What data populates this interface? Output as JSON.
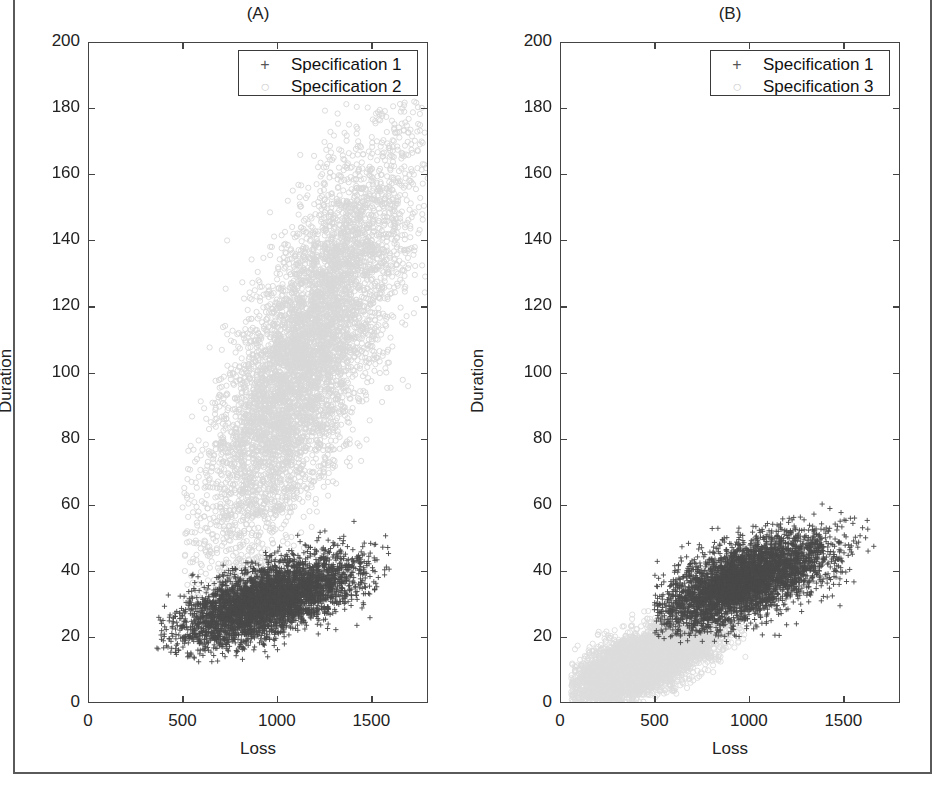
{
  "figure": {
    "background": "#ffffff",
    "border_color": "#5a5a5a"
  },
  "panels": [
    {
      "id": "A",
      "title": "(A)",
      "xlabel": "Loss",
      "ylabel": "Duration",
      "xticks": [
        0,
        500,
        1000,
        1500
      ],
      "yticks": [
        0,
        20,
        40,
        60,
        80,
        100,
        120,
        140,
        160,
        180,
        200
      ],
      "xlim": [
        0,
        1800
      ],
      "ylim": [
        0,
        200
      ],
      "legend": [
        {
          "marker": "+",
          "label": "Specification 1",
          "color": "#555555"
        },
        {
          "marker": "o",
          "label": "Specification 2",
          "color": "#d2d2d2"
        }
      ]
    },
    {
      "id": "B",
      "title": "(B)",
      "xlabel": "Loss",
      "ylabel": "Duration",
      "xticks": [
        0,
        500,
        1000,
        1500
      ],
      "yticks": [
        0,
        20,
        40,
        60,
        80,
        100,
        120,
        140,
        160,
        180,
        200
      ],
      "xlim": [
        0,
        1800
      ],
      "ylim": [
        0,
        200
      ],
      "legend": [
        {
          "marker": "+",
          "label": "Specification 1",
          "color": "#555555"
        },
        {
          "marker": "o",
          "label": "Specification 3",
          "color": "#d2d2d2"
        }
      ]
    }
  ],
  "chart_data": [
    {
      "type": "scatter",
      "panel": "A",
      "title": "(A)",
      "xlabel": "Loss",
      "ylabel": "Duration",
      "xlim": [
        0,
        1800
      ],
      "ylim": [
        0,
        200
      ],
      "xticks": [
        0,
        500,
        1000,
        1500
      ],
      "yticks": [
        0,
        20,
        40,
        60,
        80,
        100,
        120,
        140,
        160,
        180,
        200
      ],
      "grid": false,
      "legend_position": "top-right",
      "series": [
        {
          "name": "Specification 1",
          "marker": "plus",
          "color": "#4a4a4a",
          "n_points": 4200,
          "x_mean": 950,
          "x_sd": 230,
          "y_mean": 31,
          "y_sd": 6.5,
          "correlation": 0.62,
          "x_range": [
            360,
            1600
          ],
          "y_range": [
            10,
            58
          ]
        },
        {
          "name": "Specification 2",
          "marker": "circle",
          "color": "#d8d8d8",
          "n_points": 6000,
          "x_mean": 1150,
          "x_sd": 270,
          "y_mean": 105,
          "y_sd": 32,
          "correlation": 0.78,
          "x_range": [
            500,
            1800
          ],
          "y_range": [
            20,
            182
          ]
        }
      ]
    },
    {
      "type": "scatter",
      "panel": "B",
      "title": "(B)",
      "xlabel": "Loss",
      "ylabel": "Duration",
      "xlim": [
        0,
        1800
      ],
      "ylim": [
        0,
        200
      ],
      "xticks": [
        0,
        500,
        1000,
        1500
      ],
      "yticks": [
        0,
        20,
        40,
        60,
        80,
        100,
        120,
        140,
        160,
        180,
        200
      ],
      "grid": false,
      "legend_position": "top-right",
      "series": [
        {
          "name": "Specification 1",
          "marker": "plus",
          "color": "#4a4a4a",
          "n_points": 4200,
          "x_mean": 980,
          "x_sd": 225,
          "y_mean": 37,
          "y_sd": 7.0,
          "correlation": 0.6,
          "x_range": [
            500,
            1680
          ],
          "y_range": [
            18,
            62
          ]
        },
        {
          "name": "Specification 3",
          "marker": "circle",
          "color": "#dcdcdc",
          "n_points": 5200,
          "x_mean": 430,
          "x_sd": 190,
          "y_mean": 12,
          "y_sd": 6.0,
          "correlation": 0.66,
          "x_range": [
            60,
            1000
          ],
          "y_range": [
            0,
            30
          ]
        }
      ]
    }
  ]
}
